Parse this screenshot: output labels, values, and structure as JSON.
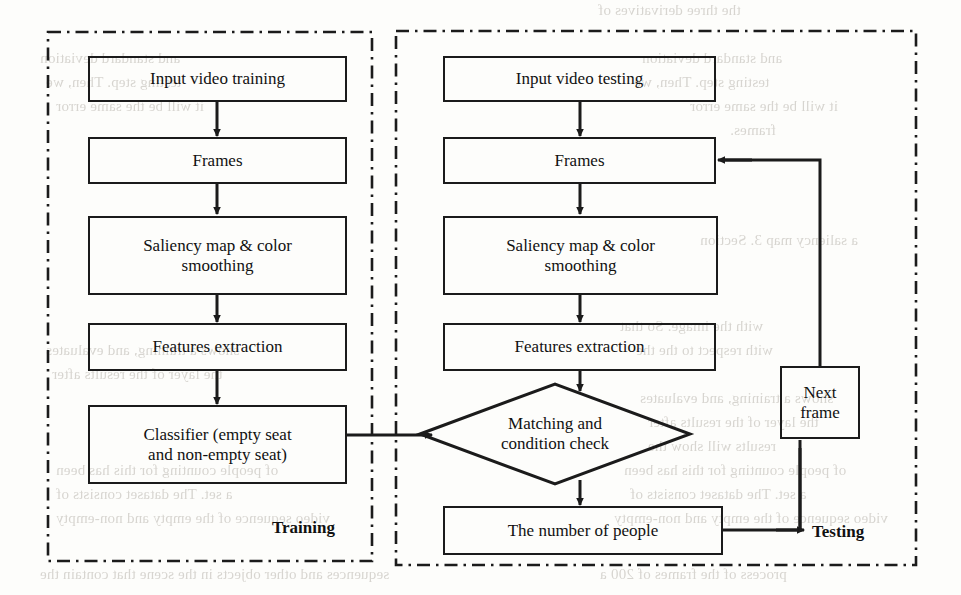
{
  "figure": {
    "type": "flowchart",
    "panels": [
      {
        "id": "training",
        "label": "Training",
        "nodes": [
          {
            "id": "train-input",
            "shape": "process",
            "label": "Input video training"
          },
          {
            "id": "train-frames",
            "shape": "process",
            "label": "Frames"
          },
          {
            "id": "train-saliency",
            "shape": "process",
            "label": "Saliency map & color smoothing"
          },
          {
            "id": "train-features",
            "shape": "process",
            "label": "Features extraction"
          },
          {
            "id": "train-classifier",
            "shape": "process",
            "label": "Classifier (empty seat and non-empty seat)"
          }
        ]
      },
      {
        "id": "testing",
        "label": "Testing",
        "nodes": [
          {
            "id": "test-input",
            "shape": "process",
            "label": "Input video testing"
          },
          {
            "id": "test-frames",
            "shape": "process",
            "label": "Frames"
          },
          {
            "id": "test-saliency",
            "shape": "process",
            "label": "Saliency map & color smoothing"
          },
          {
            "id": "test-features",
            "shape": "process",
            "label": "Features extraction"
          },
          {
            "id": "test-matching",
            "shape": "decision",
            "label": "Matching and condition check"
          },
          {
            "id": "test-count",
            "shape": "process",
            "label": "The number of people"
          },
          {
            "id": "test-nextframe",
            "shape": "process",
            "label": "Next frame"
          }
        ]
      }
    ],
    "edges": [
      {
        "from": "train-input",
        "to": "train-frames"
      },
      {
        "from": "train-frames",
        "to": "train-saliency"
      },
      {
        "from": "train-saliency",
        "to": "train-features"
      },
      {
        "from": "train-features",
        "to": "train-classifier"
      },
      {
        "from": "train-classifier",
        "to": "test-matching"
      },
      {
        "from": "test-input",
        "to": "test-frames"
      },
      {
        "from": "test-frames",
        "to": "test-saliency"
      },
      {
        "from": "test-saliency",
        "to": "test-features"
      },
      {
        "from": "test-features",
        "to": "test-matching"
      },
      {
        "from": "test-matching",
        "to": "test-count"
      },
      {
        "from": "test-count",
        "to": "test-nextframe"
      },
      {
        "from": "test-nextframe",
        "to": "test-frames"
      }
    ],
    "colors": {
      "stroke": "#1b1b1b",
      "text": "#111111",
      "page": "#fdfdfb",
      "bleed_text": "#b9b5ae"
    }
  },
  "nodes": {
    "train_input": "Input video training",
    "train_frames": "Frames",
    "train_saliency_l1": "Saliency map & color",
    "train_saliency_l2": "smoothing",
    "train_features": "Features extraction",
    "train_classifier_l1": "Classifier (empty seat",
    "train_classifier_l2": "and non-empty seat)",
    "test_input": "Input video testing",
    "test_frames": "Frames",
    "test_saliency_l1": "Saliency map & color",
    "test_saliency_l2": "smoothing",
    "test_features": "Features extraction",
    "test_matching_l1": "Matching and",
    "test_matching_l2": "condition check",
    "test_count": "The number of people",
    "test_nextframe_l1": "Next",
    "test_nextframe_l2": "frame"
  },
  "labels": {
    "training": "Training",
    "testing": "Testing"
  },
  "bleed": {
    "l01": "the three derivatives of",
    "l02": "and standard deviation",
    "l03": "testing step. Then, we",
    "l04": "it will be the same error",
    "l05": "frames.",
    "l06": "a saliency map 3. Section",
    "l07": "with the image. So that",
    "l08": "with respect to the the",
    "l09": "shows a training, and evaluates",
    "l10": "the layer of the results after",
    "l11": "results will show the",
    "l12": "of people counting for this has been",
    "l13": "a set. The dataset consists of",
    "l14": "video sequence of the empty and non-empty",
    "l15": "sequences and other objects in the scene that contain the",
    "l16": "process of the frames of 200 a"
  }
}
